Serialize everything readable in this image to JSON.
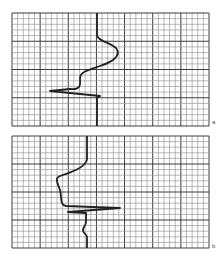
{
  "figure": {
    "panels": [
      {
        "id": "a",
        "label": "a",
        "grid": {
          "x": 12,
          "y": 13,
          "width": 197,
          "height": 113,
          "cols": 35,
          "rows": 20,
          "major_every": 5
        },
        "trace": "M97,13 L97,36 C100,42 110,42 116,48 C122,56 112,62 100,66 C88,70 80,72 80,78 C80,84 82,90 70,89 L50,91 L100,96 L97,98 L97,126"
      },
      {
        "id": "b",
        "label": "b",
        "grid": {
          "x": 12,
          "y": 136,
          "width": 197,
          "height": 112,
          "cols": 35,
          "rows": 20,
          "major_every": 5
        },
        "trace": "M87,136 L87,160 C84,168 72,172 60,176 C54,178 58,184 60,190 C62,200 60,205 66,206 L120,208 L68,212 L86,213 L86,222 C86,226 82,228 83,231 C84,234 87,234 87,237 L87,248"
      }
    ],
    "colors": {
      "grid_minor": "#9a9a9a",
      "grid_major": "#3c3c3c",
      "trace": "#222222"
    }
  }
}
